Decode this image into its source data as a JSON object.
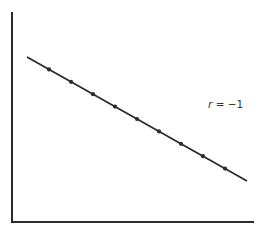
{
  "chart_data": {
    "type": "scatter",
    "title": "",
    "xlabel": "",
    "ylabel": "",
    "grid": false,
    "legend": null,
    "annotation": {
      "variable": "r",
      "equals": " = ",
      "value": "−1",
      "text": "r = −1"
    },
    "x": [
      1,
      2,
      3,
      4,
      5,
      6,
      7,
      8,
      9
    ],
    "y": [
      9,
      8,
      7,
      6,
      5,
      4,
      3,
      2,
      1
    ],
    "fit_line": {
      "x": [
        0,
        10
      ],
      "y": [
        10,
        0
      ]
    },
    "xlim": [
      -1,
      10.5
    ],
    "ylim": [
      -2.5,
      13
    ],
    "axis_ticks": false
  },
  "colors": {
    "ink": "#2b2b2b",
    "background": "#ffffff"
  }
}
